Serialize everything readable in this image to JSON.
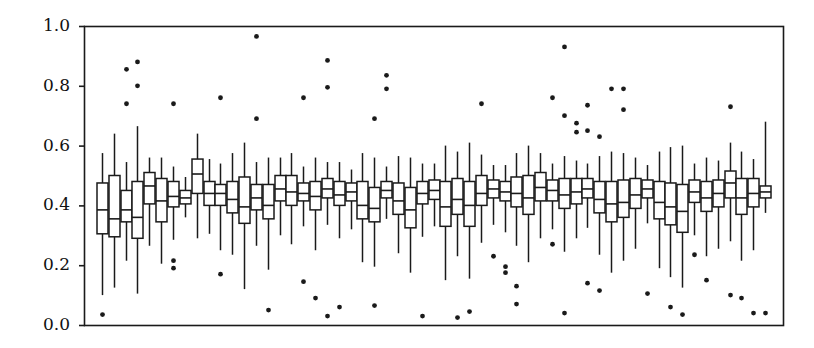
{
  "figure": {
    "kind": "boxplot-figure",
    "background_color": "#ffffff",
    "ink_color": "#1a1a1a",
    "title": "",
    "xlabel": "",
    "ylabel": ""
  },
  "axes": {
    "frame": {
      "left": 84,
      "top": 26,
      "right": 783,
      "bottom": 325
    },
    "y_tick_labels": [
      "1.0",
      "0.8",
      "0.6",
      "0.4",
      "0.2",
      "0.0"
    ],
    "y_tick_values": [
      1.0,
      0.8,
      0.6,
      0.4,
      0.2,
      0.0
    ],
    "x_tick_labels": [],
    "grid": false,
    "frame_visible": true
  },
  "chart_data": {
    "type": "box",
    "title": "",
    "xlabel": "",
    "ylabel": "",
    "ylim": [
      0.0,
      1.0
    ],
    "xlim": [
      0,
      58
    ],
    "grid": false,
    "legend": null,
    "y_ticks": [
      0.0,
      0.2,
      0.4,
      0.6,
      0.8,
      1.0
    ],
    "n_boxes": 57,
    "box_width_px": 11,
    "box_spacing_px": 11.4,
    "series_name": "distribution",
    "boxes": [
      {
        "i": 1,
        "whislo": 0.1,
        "q1": 0.305,
        "med": 0.385,
        "q3": 0.475,
        "whishi": 0.575,
        "fliers": [
          0.035
        ]
      },
      {
        "i": 2,
        "whislo": 0.125,
        "q1": 0.295,
        "med": 0.355,
        "q3": 0.5,
        "whishi": 0.64,
        "fliers": []
      },
      {
        "i": 3,
        "whislo": 0.215,
        "q1": 0.345,
        "med": 0.385,
        "q3": 0.45,
        "whishi": 0.545,
        "fliers": [
          0.855,
          0.74
        ]
      },
      {
        "i": 4,
        "whislo": 0.105,
        "q1": 0.29,
        "med": 0.36,
        "q3": 0.48,
        "whishi": 0.665,
        "fliers": [
          0.8,
          0.88
        ]
      },
      {
        "i": 5,
        "whislo": 0.265,
        "q1": 0.405,
        "med": 0.465,
        "q3": 0.51,
        "whishi": 0.56,
        "fliers": []
      },
      {
        "i": 6,
        "whislo": 0.205,
        "q1": 0.345,
        "med": 0.415,
        "q3": 0.49,
        "whishi": 0.56,
        "fliers": []
      },
      {
        "i": 7,
        "whislo": 0.285,
        "q1": 0.395,
        "med": 0.43,
        "q3": 0.48,
        "whishi": 0.53,
        "fliers": [
          0.74,
          0.215,
          0.19
        ]
      },
      {
        "i": 8,
        "whislo": 0.36,
        "q1": 0.405,
        "med": 0.425,
        "q3": 0.45,
        "whishi": 0.495,
        "fliers": []
      },
      {
        "i": 9,
        "whislo": 0.29,
        "q1": 0.44,
        "med": 0.505,
        "q3": 0.555,
        "whishi": 0.64,
        "fliers": []
      },
      {
        "i": 10,
        "whislo": 0.305,
        "q1": 0.4,
        "med": 0.44,
        "q3": 0.48,
        "whishi": 0.555,
        "fliers": []
      },
      {
        "i": 11,
        "whislo": 0.25,
        "q1": 0.4,
        "med": 0.44,
        "q3": 0.47,
        "whishi": 0.54,
        "fliers": [
          0.76,
          0.17
        ]
      },
      {
        "i": 12,
        "whislo": 0.235,
        "q1": 0.375,
        "med": 0.42,
        "q3": 0.48,
        "whishi": 0.575,
        "fliers": []
      },
      {
        "i": 13,
        "whislo": 0.12,
        "q1": 0.34,
        "med": 0.395,
        "q3": 0.495,
        "whishi": 0.61,
        "fliers": []
      },
      {
        "i": 14,
        "whislo": 0.265,
        "q1": 0.385,
        "med": 0.425,
        "q3": 0.47,
        "whishi": 0.545,
        "fliers": [
          0.965,
          0.69
        ]
      },
      {
        "i": 15,
        "whislo": 0.185,
        "q1": 0.355,
        "med": 0.4,
        "q3": 0.47,
        "whishi": 0.56,
        "fliers": [
          0.05
        ]
      },
      {
        "i": 16,
        "whislo": 0.3,
        "q1": 0.415,
        "med": 0.455,
        "q3": 0.5,
        "whishi": 0.56,
        "fliers": []
      },
      {
        "i": 17,
        "whislo": 0.27,
        "q1": 0.4,
        "med": 0.445,
        "q3": 0.5,
        "whishi": 0.575,
        "fliers": []
      },
      {
        "i": 18,
        "whislo": 0.33,
        "q1": 0.415,
        "med": 0.44,
        "q3": 0.475,
        "whishi": 0.53,
        "fliers": [
          0.76,
          0.145
        ]
      },
      {
        "i": 19,
        "whislo": 0.25,
        "q1": 0.385,
        "med": 0.43,
        "q3": 0.48,
        "whishi": 0.56,
        "fliers": [
          0.09
        ]
      },
      {
        "i": 20,
        "whislo": 0.335,
        "q1": 0.425,
        "med": 0.455,
        "q3": 0.49,
        "whishi": 0.545,
        "fliers": [
          0.885,
          0.795,
          0.03
        ]
      },
      {
        "i": 21,
        "whislo": 0.29,
        "q1": 0.4,
        "med": 0.435,
        "q3": 0.48,
        "whishi": 0.545,
        "fliers": [
          0.06
        ]
      },
      {
        "i": 22,
        "whislo": 0.32,
        "q1": 0.415,
        "med": 0.445,
        "q3": 0.475,
        "whishi": 0.52,
        "fliers": []
      },
      {
        "i": 23,
        "whislo": 0.21,
        "q1": 0.355,
        "med": 0.4,
        "q3": 0.48,
        "whishi": 0.575,
        "fliers": []
      },
      {
        "i": 24,
        "whislo": 0.195,
        "q1": 0.345,
        "med": 0.39,
        "q3": 0.46,
        "whishi": 0.56,
        "fliers": [
          0.69,
          0.065
        ]
      },
      {
        "i": 25,
        "whislo": 0.355,
        "q1": 0.425,
        "med": 0.45,
        "q3": 0.48,
        "whishi": 0.53,
        "fliers": [
          0.835,
          0.79
        ]
      },
      {
        "i": 26,
        "whislo": 0.24,
        "q1": 0.37,
        "med": 0.415,
        "q3": 0.475,
        "whishi": 0.565,
        "fliers": []
      },
      {
        "i": 27,
        "whislo": 0.175,
        "q1": 0.325,
        "med": 0.385,
        "q3": 0.46,
        "whishi": 0.56,
        "fliers": []
      },
      {
        "i": 28,
        "whislo": 0.295,
        "q1": 0.405,
        "med": 0.44,
        "q3": 0.48,
        "whishi": 0.54,
        "fliers": [
          0.03
        ]
      },
      {
        "i": 29,
        "whislo": 0.33,
        "q1": 0.42,
        "med": 0.45,
        "q3": 0.485,
        "whishi": 0.54,
        "fliers": []
      },
      {
        "i": 30,
        "whislo": 0.15,
        "q1": 0.33,
        "med": 0.395,
        "q3": 0.48,
        "whishi": 0.6,
        "fliers": []
      },
      {
        "i": 31,
        "whislo": 0.23,
        "q1": 0.37,
        "med": 0.42,
        "q3": 0.49,
        "whishi": 0.58,
        "fliers": [
          0.025
        ]
      },
      {
        "i": 32,
        "whislo": 0.155,
        "q1": 0.33,
        "med": 0.4,
        "q3": 0.48,
        "whishi": 0.61,
        "fliers": [
          0.045
        ]
      },
      {
        "i": 33,
        "whislo": 0.275,
        "q1": 0.4,
        "med": 0.44,
        "q3": 0.5,
        "whishi": 0.57,
        "fliers": [
          0.74
        ]
      },
      {
        "i": 34,
        "whislo": 0.335,
        "q1": 0.425,
        "med": 0.455,
        "q3": 0.485,
        "whishi": 0.535,
        "fliers": [
          0.23
        ]
      },
      {
        "i": 35,
        "whislo": 0.31,
        "q1": 0.415,
        "med": 0.445,
        "q3": 0.48,
        "whishi": 0.535,
        "fliers": [
          0.195,
          0.175
        ]
      },
      {
        "i": 36,
        "whislo": 0.265,
        "q1": 0.395,
        "med": 0.44,
        "q3": 0.495,
        "whishi": 0.575,
        "fliers": [
          0.13,
          0.07
        ]
      },
      {
        "i": 37,
        "whislo": 0.21,
        "q1": 0.37,
        "med": 0.425,
        "q3": 0.5,
        "whishi": 0.6,
        "fliers": []
      },
      {
        "i": 38,
        "whislo": 0.29,
        "q1": 0.415,
        "med": 0.46,
        "q3": 0.51,
        "whishi": 0.575,
        "fliers": []
      },
      {
        "i": 39,
        "whislo": 0.32,
        "q1": 0.415,
        "med": 0.45,
        "q3": 0.485,
        "whishi": 0.54,
        "fliers": [
          0.76,
          0.27
        ]
      },
      {
        "i": 40,
        "whislo": 0.245,
        "q1": 0.39,
        "med": 0.435,
        "q3": 0.49,
        "whishi": 0.565,
        "fliers": [
          0.93,
          0.7,
          0.04
        ]
      },
      {
        "i": 41,
        "whislo": 0.29,
        "q1": 0.405,
        "med": 0.445,
        "q3": 0.49,
        "whishi": 0.55,
        "fliers": [
          0.675,
          0.645
        ]
      },
      {
        "i": 42,
        "whislo": 0.325,
        "q1": 0.425,
        "med": 0.455,
        "q3": 0.49,
        "whishi": 0.54,
        "fliers": [
          0.735,
          0.65,
          0.14
        ]
      },
      {
        "i": 43,
        "whislo": 0.235,
        "q1": 0.375,
        "med": 0.42,
        "q3": 0.48,
        "whishi": 0.565,
        "fliers": [
          0.63,
          0.115
        ]
      },
      {
        "i": 44,
        "whislo": 0.175,
        "q1": 0.345,
        "med": 0.405,
        "q3": 0.48,
        "whishi": 0.58,
        "fliers": [
          0.79
        ]
      },
      {
        "i": 45,
        "whislo": 0.215,
        "q1": 0.36,
        "med": 0.41,
        "q3": 0.485,
        "whishi": 0.575,
        "fliers": [
          0.72,
          0.79
        ]
      },
      {
        "i": 46,
        "whislo": 0.255,
        "q1": 0.39,
        "med": 0.435,
        "q3": 0.49,
        "whishi": 0.56,
        "fliers": []
      },
      {
        "i": 47,
        "whislo": 0.34,
        "q1": 0.425,
        "med": 0.455,
        "q3": 0.485,
        "whishi": 0.535,
        "fliers": [
          0.105
        ]
      },
      {
        "i": 48,
        "whislo": 0.19,
        "q1": 0.355,
        "med": 0.41,
        "q3": 0.48,
        "whishi": 0.58,
        "fliers": []
      },
      {
        "i": 49,
        "whislo": 0.16,
        "q1": 0.335,
        "med": 0.395,
        "q3": 0.475,
        "whishi": 0.595,
        "fliers": [
          0.06
        ]
      },
      {
        "i": 50,
        "whislo": 0.125,
        "q1": 0.31,
        "med": 0.38,
        "q3": 0.47,
        "whishi": 0.6,
        "fliers": [
          0.035
        ]
      },
      {
        "i": 51,
        "whislo": 0.3,
        "q1": 0.41,
        "med": 0.445,
        "q3": 0.485,
        "whishi": 0.54,
        "fliers": [
          0.235
        ]
      },
      {
        "i": 52,
        "whislo": 0.23,
        "q1": 0.38,
        "med": 0.425,
        "q3": 0.48,
        "whishi": 0.56,
        "fliers": [
          0.15
        ]
      },
      {
        "i": 53,
        "whislo": 0.255,
        "q1": 0.395,
        "med": 0.44,
        "q3": 0.485,
        "whishi": 0.55,
        "fliers": []
      },
      {
        "i": 54,
        "whislo": 0.28,
        "q1": 0.425,
        "med": 0.475,
        "q3": 0.515,
        "whishi": 0.61,
        "fliers": [
          0.73,
          0.1
        ]
      },
      {
        "i": 55,
        "whislo": 0.215,
        "q1": 0.37,
        "med": 0.425,
        "q3": 0.49,
        "whishi": 0.58,
        "fliers": [
          0.09
        ]
      },
      {
        "i": 56,
        "whislo": 0.25,
        "q1": 0.395,
        "med": 0.44,
        "q3": 0.49,
        "whishi": 0.555,
        "fliers": [
          0.04
        ]
      },
      {
        "i": 57,
        "whislo": 0.375,
        "q1": 0.425,
        "med": 0.445,
        "q3": 0.465,
        "whishi": 0.68,
        "fliers": [
          0.04
        ]
      }
    ]
  }
}
